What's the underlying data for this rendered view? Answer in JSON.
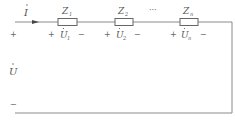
{
  "diagram": {
    "type": "series-impedance-circuit",
    "current_label": "I",
    "source": {
      "voltage_label": "U",
      "plus": "+",
      "minus": "−"
    },
    "impedances": [
      {
        "label": "Z",
        "sub": "1",
        "voltage": "U",
        "voltage_sub": "1",
        "plus": "+",
        "minus": "−"
      },
      {
        "label": "Z",
        "sub": "2",
        "voltage": "U",
        "voltage_sub": "2",
        "plus": "+",
        "minus": "−"
      },
      {
        "label": "Z",
        "sub": "n",
        "voltage": "U",
        "voltage_sub": "n",
        "plus": "+",
        "minus": "−"
      }
    ],
    "ellipsis": "···",
    "colors": {
      "wire": "#8a8a8a",
      "text": "#555555"
    }
  }
}
